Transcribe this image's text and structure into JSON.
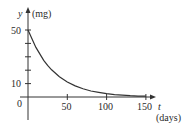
{
  "chart_data": {
    "type": "line",
    "title": "",
    "xlabel": "t",
    "xlabel_unit": "(days)",
    "ylabel": "y",
    "ylabel_unit": "(mg)",
    "xlim": [
      0,
      160
    ],
    "ylim": [
      0,
      52
    ],
    "x_ticks": [
      0,
      50,
      100,
      150
    ],
    "x_tick_labels": [
      "0",
      "50",
      "100",
      "150"
    ],
    "y_ticks": [
      10,
      20,
      30,
      40,
      50
    ],
    "y_tick_labels": [
      "10",
      "50"
    ],
    "origin_label": "0",
    "grid": false,
    "legend": null,
    "series": [
      {
        "name": "y = 50e^(-0.03t)",
        "x": [
          0,
          10,
          20,
          25,
          30,
          40,
          50,
          60,
          70,
          80,
          90,
          100,
          110,
          120,
          130,
          140,
          150,
          160
        ],
        "values": [
          50,
          37.0,
          27.4,
          23.6,
          20.3,
          15.1,
          11.2,
          8.3,
          6.1,
          4.5,
          3.4,
          2.5,
          1.8,
          1.4,
          1.0,
          0.7,
          0.6,
          0.4
        ]
      }
    ],
    "line_color": "#333333"
  },
  "labels": {
    "y_axis": "y",
    "y_unit": "(mg)",
    "x_axis": "t",
    "x_unit": "(days)",
    "origin": "0",
    "y50": "50",
    "y10": "10",
    "x50": "50",
    "x100": "100",
    "x150": "150"
  }
}
